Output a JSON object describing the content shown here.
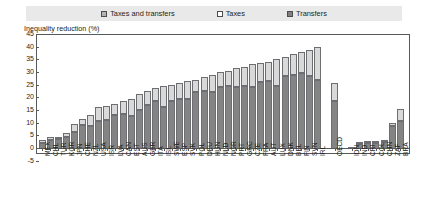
{
  "legend": {
    "items": [
      {
        "label": "Taxes and transfers",
        "icon": "square-swatch-icon",
        "color": "#b3b3b3"
      },
      {
        "label": "Taxes",
        "icon": "square-swatch-icon",
        "color": "#ffffff"
      },
      {
        "label": "Transfers",
        "icon": "square-swatch-icon",
        "color": "#808080"
      }
    ]
  },
  "chart_data": {
    "type": "bar",
    "title": "",
    "subtitle": "",
    "xlabel": "",
    "ylabel": "Inequality reduction (%)",
    "ylim": [
      -5,
      45
    ],
    "yticks": [
      -5,
      0,
      5,
      10,
      15,
      20,
      25,
      30,
      35,
      40,
      45
    ],
    "grid": false,
    "stacked": true,
    "legend_position": "top",
    "categories": [
      "MEX",
      "CHL",
      "TUR",
      "KOR",
      "JPN",
      "CHE",
      "NZL",
      "USA",
      "ISR",
      "LVA",
      "CAN",
      "EST",
      "AUS",
      "GBR",
      "ITA",
      "ISL",
      "SWE",
      "ESP",
      "SVK",
      "POL",
      "DEU",
      "HUN",
      "NLD",
      "NOR",
      "PRT",
      "GRC",
      "CZE",
      "FRA",
      "AUT",
      "LUX",
      "DNK",
      "BEL",
      "FIN",
      "SVN",
      "IRL",
      "OECD",
      "IDN",
      "IND",
      "CRI",
      "COL",
      "CHN",
      "ZAF",
      "BRA"
    ],
    "series": [
      {
        "name": "Transfers",
        "color": "#848484",
        "values": [
          2.0,
          3.0,
          3.5,
          4.5,
          6.5,
          9.0,
          8.5,
          10.5,
          11.0,
          13.0,
          13.5,
          12.5,
          15.0,
          17.0,
          18.5,
          16.0,
          18.5,
          19.5,
          19.5,
          22.0,
          22.5,
          22.0,
          24.0,
          24.5,
          24.0,
          24.5,
          24.0,
          26.0,
          26.5,
          24.5,
          28.5,
          29.0,
          29.5,
          28.5,
          27.0,
          18.5,
          0.5,
          1.5,
          2.0,
          2.0,
          2.5,
          8.5,
          10.5
        ]
      },
      {
        "name": "Taxes",
        "color": "#d9d9d9",
        "values": [
          1.0,
          1.5,
          1.0,
          1.5,
          3.0,
          2.5,
          4.5,
          5.5,
          5.5,
          4.5,
          5.0,
          7.0,
          6.5,
          5.5,
          5.0,
          8.5,
          6.5,
          6.0,
          7.0,
          5.0,
          5.5,
          7.0,
          6.0,
          6.0,
          7.5,
          7.5,
          9.0,
          7.5,
          7.5,
          10.5,
          7.5,
          8.0,
          8.5,
          10.0,
          13.0,
          7.0,
          0.0,
          0.5,
          0.5,
          0.5,
          0.5,
          1.5,
          5.0
        ]
      }
    ],
    "groups": [
      {
        "name": "countries",
        "start": 0,
        "end": 34
      },
      {
        "name": "oecd-average",
        "start": 35,
        "end": 35
      },
      {
        "name": "emerging-economies",
        "start": 36,
        "end": 42
      }
    ]
  }
}
